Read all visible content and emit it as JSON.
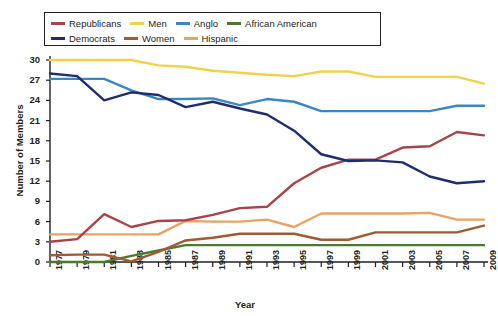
{
  "chart_data": {
    "type": "line",
    "title": "",
    "xlabel": "Year",
    "ylabel": "Number of Members",
    "ylim": [
      0,
      30
    ],
    "yticks": [
      0,
      3,
      6,
      9,
      12,
      15,
      18,
      21,
      24,
      27,
      30
    ],
    "grid": false,
    "legend_position": "top",
    "categories": [
      "1977",
      "1979",
      "1981",
      "1983",
      "1985",
      "1987",
      "1989",
      "1991",
      "1993",
      "1995",
      "1997",
      "1999",
      "2001",
      "2003",
      "2005",
      "2007",
      "2009"
    ],
    "x": [
      1977,
      1979,
      1981,
      1983,
      1985,
      1987,
      1989,
      1991,
      1993,
      1995,
      1997,
      1999,
      2001,
      2003,
      2005,
      2007,
      2009
    ],
    "series": [
      {
        "name": "Republicans",
        "color": "#a8434a",
        "values": [
          3,
          3.4,
          7.1,
          5.2,
          6.1,
          6.2,
          7,
          8,
          8.2,
          11.7,
          14,
          15.2,
          15.2,
          17,
          17.2,
          19.3,
          18.8
        ]
      },
      {
        "name": "Democrats",
        "color": "#1f2d6e",
        "values": [
          28,
          27.6,
          24,
          25.2,
          24.8,
          23,
          23.8,
          22.8,
          21.9,
          19.5,
          16,
          15,
          15.1,
          14.8,
          12.7,
          11.7,
          12
        ]
      },
      {
        "name": "Men",
        "color": "#f2d24b",
        "values": [
          30,
          30,
          30,
          30,
          29.2,
          29,
          28.4,
          28.1,
          27.8,
          27.6,
          28.3,
          28.3,
          27.5,
          27.5,
          27.5,
          27.5,
          26.5
        ]
      },
      {
        "name": "Women",
        "color": "#a05a36",
        "values": [
          1,
          1.1,
          1.1,
          0.1,
          1.5,
          3.2,
          3.6,
          4.2,
          4.2,
          4.2,
          3.3,
          3.3,
          4.4,
          4.4,
          4.4,
          4.4,
          5.4
        ]
      },
      {
        "name": "Anglo",
        "color": "#3b87c4",
        "values": [
          27.2,
          27.2,
          27.2,
          25.5,
          24.2,
          24.2,
          24.3,
          23.3,
          24.2,
          23.8,
          22.4,
          22.4,
          22.4,
          22.4,
          22.4,
          23.2,
          23.2
        ]
      },
      {
        "name": "Hispanic",
        "color": "#e8a361",
        "values": [
          4.1,
          4.1,
          4.1,
          4.1,
          4.1,
          6.1,
          6,
          6,
          6.3,
          5.2,
          7.2,
          7.2,
          7.2,
          7.2,
          7.3,
          6.3,
          6.3
        ]
      },
      {
        "name": "African American",
        "color": "#4c7a2b",
        "values": [
          0,
          0,
          0,
          0.9,
          1.7,
          2.5,
          2.5,
          2.5,
          2.5,
          2.5,
          2.5,
          2.5,
          2.5,
          2.5,
          2.5,
          2.5,
          2.5
        ]
      }
    ]
  },
  "legend": {
    "rows": [
      [
        {
          "label": "Republicans",
          "color": "#a8434a"
        },
        {
          "label": "Men",
          "color": "#f2d24b"
        },
        {
          "label": "Anglo",
          "color": "#3b87c4"
        },
        {
          "label": "African American",
          "color": "#4c7a2b"
        }
      ],
      [
        {
          "label": "Democrats",
          "color": "#1f2d6e"
        },
        {
          "label": "Women",
          "color": "#a05a36"
        },
        {
          "label": "Hispanic",
          "color": "#e8a361"
        }
      ]
    ]
  },
  "axes": {
    "y_title": "Number of Members",
    "x_title": "Year",
    "axis_color": "#231f20"
  }
}
